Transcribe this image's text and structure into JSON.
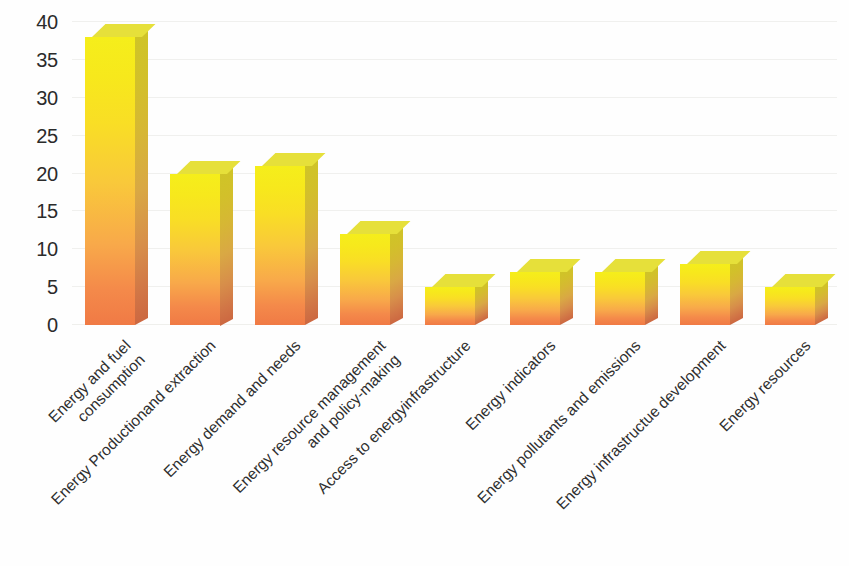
{
  "chart_data": {
    "type": "bar",
    "title": "",
    "subtitle": "",
    "xlabel": "",
    "ylabel": "",
    "ylim": [
      0,
      40
    ],
    "yticks": [
      0,
      5,
      10,
      15,
      20,
      25,
      30,
      35,
      40
    ],
    "grid": true,
    "legend": false,
    "legend_position": "none",
    "categories": [
      "Energy and fuel\nconsumption",
      "Energy Productionand extraction",
      "Energy demand and needs",
      "Energy resource management\nand policy-making",
      "Access to energyinfrastructure",
      "Energy indicators",
      "Energy pollutants and emissions",
      "Energy infrastructue development",
      "Energy resources"
    ],
    "values": [
      38,
      20,
      21,
      12,
      5,
      7,
      7,
      8,
      5
    ],
    "bar_style": {
      "three_d": true,
      "gradient_top_color": "#f5ee1b",
      "gradient_bottom_color": "#f07a45",
      "side_face_color": "#d3a33c",
      "top_face_color": "#e6e03a"
    },
    "axis_text_color": "#2b2b2b",
    "gridline_color": "#f0f0ee",
    "background_color": "#fefefe"
  }
}
